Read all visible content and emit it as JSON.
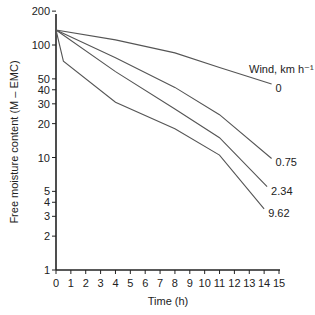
{
  "chart_data": {
    "type": "line",
    "title": "",
    "xlabel": "Time (h)",
    "ylabel": "Free moisture content (M – EMC)",
    "x_ticks": [
      0,
      1,
      2,
      3,
      4,
      5,
      6,
      7,
      8,
      9,
      10,
      11,
      12,
      13,
      14,
      15
    ],
    "xlim": [
      0,
      15
    ],
    "y_scale": "log",
    "y_ticks": [
      1,
      2,
      3,
      4,
      5,
      10,
      20,
      30,
      40,
      50,
      100,
      200
    ],
    "ylim": [
      1,
      200
    ],
    "grid": false,
    "legend_title": "Wind, km h⁻¹",
    "legend_position": "right, inline labels at line ends",
    "series": [
      {
        "name": "0",
        "x": [
          0,
          4,
          8,
          11,
          14.5
        ],
        "values": [
          136,
          111,
          85,
          63,
          45
        ]
      },
      {
        "name": "0.75",
        "x": [
          0,
          4,
          8,
          11,
          14.5
        ],
        "values": [
          136,
          77,
          42,
          24,
          9.8
        ]
      },
      {
        "name": "2.34",
        "x": [
          0,
          4,
          8,
          11,
          14.2
        ],
        "values": [
          136,
          58,
          27,
          15,
          5.5
        ]
      },
      {
        "name": "9.62",
        "x": [
          0,
          0.5,
          4,
          8,
          11,
          14.0
        ],
        "values": [
          136,
          72,
          31,
          18,
          10.5,
          3.5
        ]
      }
    ]
  }
}
